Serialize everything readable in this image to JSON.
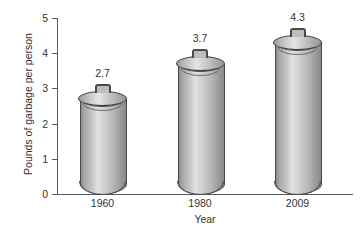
{
  "chart_data": {
    "type": "bar",
    "title": "",
    "xlabel": "Year",
    "ylabel": "Pounds of garbage per person",
    "categories": [
      "1960",
      "1980",
      "2009"
    ],
    "values": [
      2.7,
      3.7,
      4.3
    ],
    "value_labels": [
      "2.7",
      "3.7",
      "4.3"
    ],
    "ylim": [
      0,
      5
    ],
    "yticks": [
      "5",
      "4",
      "3",
      "2",
      "1",
      "0"
    ],
    "ytick_values": [
      5,
      4,
      3,
      2,
      1,
      0
    ],
    "grid": false,
    "legend": null,
    "bar_style": "trash-can-cylinder",
    "colors": {
      "bar_light": "#e2e2e2",
      "bar_mid": "#bdbdbd",
      "bar_dark": "#8a8a8a",
      "outline": "#4a4a4a",
      "axis": "#5a5a5a",
      "text": "#333333",
      "background": "#ffffff"
    }
  }
}
